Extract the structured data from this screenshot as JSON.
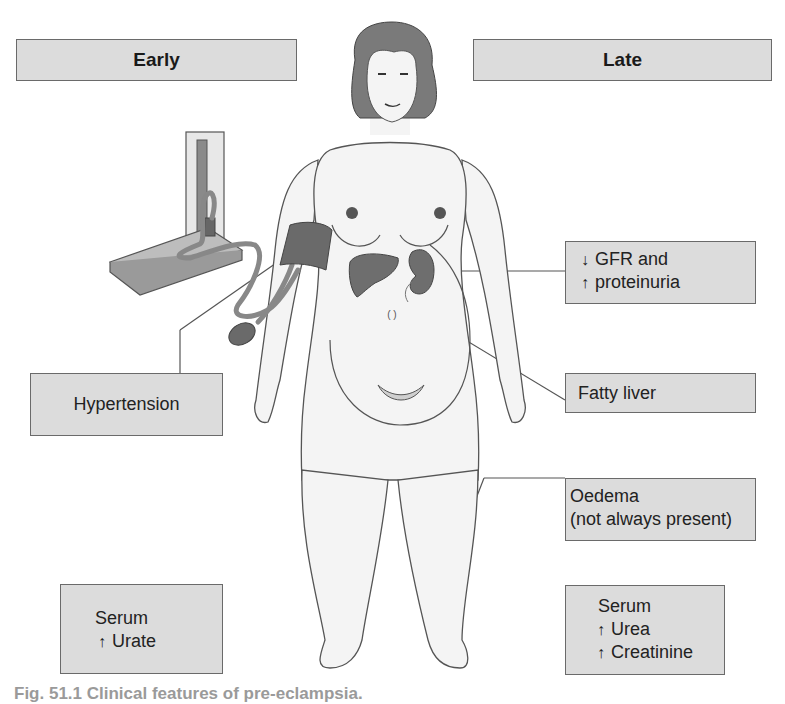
{
  "headers": {
    "early": "Early",
    "late": "Late"
  },
  "labels": {
    "gfr": {
      "arrow1": "↓",
      "line1": "GFR and",
      "arrow2": "↑",
      "line2": "proteinuria"
    },
    "fatty_liver": "Fatty liver",
    "hypertension": "Hypertension",
    "oedema": {
      "line1": "Oedema",
      "line2": "(not always present)"
    },
    "serum_early": {
      "line1": "Serum",
      "arrow": "↑",
      "line2": "Urate"
    },
    "serum_late": {
      "line1": "Serum",
      "arrow1": "↑",
      "line2": "Urea",
      "arrow2": "↑",
      "line3": "Creatinine"
    }
  },
  "illustration": {
    "subject": "pregnant-woman-figure",
    "devices": [
      "sphygmomanometer",
      "blood-pressure-cuff",
      "inflation-bulb"
    ],
    "organs": [
      "liver",
      "kidney"
    ]
  },
  "colors": {
    "box_fill": "#dcdcdc",
    "box_border": "#6a6a6a",
    "organ_fill": "#6e6e6e",
    "hair_fill": "#7a7a7a",
    "body_fill": "#f4f4f4",
    "outline": "#555555"
  },
  "caption": "Fig. 51.1  Clinical features of pre-eclampsia."
}
